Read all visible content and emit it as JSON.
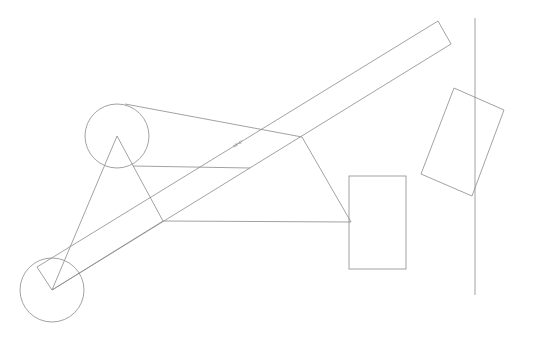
{
  "canvas": {
    "width": 534,
    "height": 341,
    "background": "#ffffff",
    "line_color": "#8a8a8a"
  },
  "dimension_label": "18'-6\"",
  "shapes": {
    "circle_upper": {
      "cx": 117,
      "cy": 136,
      "r": 32
    },
    "circle_lower": {
      "cx": 52,
      "cy": 290,
      "r": 32
    },
    "long_bar": "37,267 438,21 451,44 52,290",
    "triangle": "117,136 52,290 163,221",
    "quadrilateral": "125,104 302,137 351,222 163,221",
    "horizontal_line": {
      "x1": 133,
      "y1": 166,
      "x2": 250,
      "y2": 168
    },
    "rectangle": {
      "x": 349,
      "y": 176,
      "w": 57,
      "h": 93
    },
    "rotated_rectangle": "454,88 504,110 472,196 421,174",
    "vertical_line": {
      "x1": 475,
      "y1": 18,
      "x2": 475,
      "y2": 295
    }
  }
}
